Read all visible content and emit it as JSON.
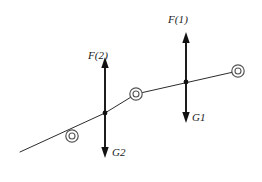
{
  "figure": {
    "title": "",
    "background_color": "#ffffff",
    "line_color": "#2b2b2b",
    "arrow_color": "#111111",
    "node_stroke_color": "#555555",
    "labels": {
      "force_1": "F(1)",
      "force_2": "F(2)",
      "weight_1": "G1",
      "weight_2": "G2"
    },
    "nodes": [
      {
        "name": "node-left",
        "cx": 72,
        "cy": 136,
        "r_outer": 6.2,
        "r_inner": 3.0
      },
      {
        "name": "node-middle",
        "cx": 136,
        "cy": 94,
        "r_outer": 6.2,
        "r_inner": 3.0
      },
      {
        "name": "node-right",
        "cx": 238,
        "cy": 71,
        "r_outer": 6.2,
        "r_inner": 3.0
      }
    ],
    "chain_path": "M20,152 L105,113 L136,94 L238,71",
    "forces": [
      {
        "name": "force-arrow-2",
        "x": 105,
        "top_y": 57,
        "bottom_y": 158,
        "joint_y": 113,
        "up_label": "F(2)",
        "down_label": "G2"
      },
      {
        "name": "force-arrow-1",
        "x": 186,
        "top_y": 32,
        "bottom_y": 123,
        "joint_y": 82,
        "up_label": "F(1)",
        "down_label": "G1"
      }
    ]
  }
}
